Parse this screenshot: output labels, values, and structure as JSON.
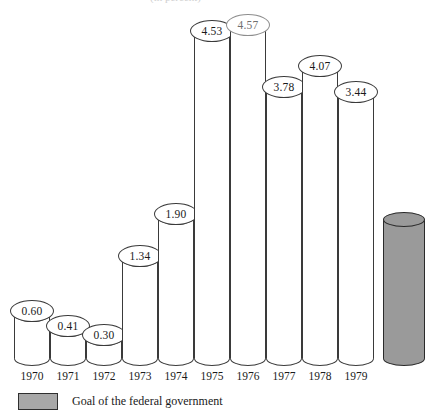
{
  "chart_data": {
    "type": "bar",
    "title": "(in percent)",
    "xlabel": "",
    "ylabel": "",
    "categories": [
      "1970",
      "1971",
      "1972",
      "1973",
      "1974",
      "1975",
      "1976",
      "1977",
      "1978",
      "1979"
    ],
    "values": [
      0.6,
      0.41,
      0.3,
      1.34,
      1.9,
      4.53,
      4.57,
      3.78,
      4.07,
      3.44
    ],
    "value_labels": [
      "0.60",
      "0.41",
      "0.30",
      "1.34",
      "1.90",
      "4.53",
      "4.57",
      "3.78",
      "4.07",
      "3.44"
    ],
    "ylim": [
      0,
      5.0
    ],
    "grid": false,
    "legend_position": "bottom-left",
    "series": [
      {
        "name": "Annual value",
        "values": [
          0.6,
          0.41,
          0.3,
          1.34,
          1.9,
          4.53,
          4.57,
          3.78,
          4.07,
          3.44
        ]
      }
    ],
    "goal_bar": {
      "label": "Goal of the federal government",
      "value": 4.53,
      "color": "#9a9a9a",
      "value_label": ""
    },
    "annotations": [],
    "style": "3d-cylinder"
  },
  "legend": {
    "swatch_color": "#a8a8a8",
    "text": "Goal of the federal government"
  },
  "bars": [
    {
      "year": "1970",
      "label": "0.60",
      "x": 14,
      "top": 307,
      "faded": false,
      "label_x": 14,
      "label_y": 300
    },
    {
      "year": "1971",
      "label": "0.41",
      "x": 50,
      "top": 322,
      "faded": false,
      "label_x": 50,
      "label_y": 315
    },
    {
      "year": "1972",
      "label": "0.30",
      "x": 86,
      "top": 331,
      "faded": false,
      "label_x": 86,
      "label_y": 324
    },
    {
      "year": "1973",
      "label": "1.34",
      "x": 122,
      "top": 252,
      "faded": false,
      "label_x": 122,
      "label_y": 245
    },
    {
      "year": "1974",
      "label": "1.90",
      "x": 158,
      "top": 210,
      "faded": false,
      "label_x": 158,
      "label_y": 203
    },
    {
      "year": "1975",
      "label": "4.53",
      "x": 194,
      "top": 22,
      "faded": false,
      "label_x": 194,
      "label_y": 20
    },
    {
      "year": "1976",
      "label": "4.57",
      "x": 230,
      "top": 16,
      "faded": true,
      "label_x": 230,
      "label_y": 14
    },
    {
      "year": "1977",
      "label": "3.78",
      "x": 266,
      "top": 77,
      "faded": false,
      "label_x": 266,
      "label_y": 76
    },
    {
      "year": "1978",
      "label": "4.07",
      "x": 302,
      "top": 56,
      "faded": false,
      "label_x": 302,
      "label_y": 55
    },
    {
      "year": "1979",
      "label": "3.44",
      "x": 338,
      "top": 82,
      "faded": false,
      "label_x": 338,
      "label_y": 81
    }
  ],
  "goal": {
    "x": 383,
    "top": 212,
    "width": 42
  },
  "axis": {
    "baseline_y": 366,
    "year_label_y": 370
  }
}
